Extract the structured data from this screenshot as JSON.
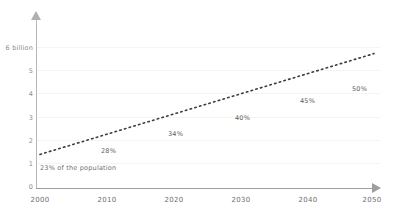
{
  "chart_data": {
    "type": "line",
    "title": "",
    "subtitle": "",
    "xlabel": "",
    "ylabel": "",
    "x": [
      2000,
      2010,
      2020,
      2030,
      2040,
      2050
    ],
    "values": [
      1.2,
      1.9,
      2.6,
      3.3,
      4.05,
      4.8
    ],
    "series": [
      {
        "name": "Urban population",
        "values": [
          1.2,
          1.9,
          2.6,
          3.3,
          4.05,
          4.8
        ]
      }
    ],
    "xlim": [
      2000,
      2050
    ],
    "ylim": [
      0,
      6
    ],
    "grid": true,
    "legend": "none",
    "line_style": "dotted",
    "line_color": "#3c3c3c",
    "y_ticks": [
      {
        "value": 6,
        "label": "6 billion"
      },
      {
        "value": 5,
        "label": "5"
      },
      {
        "value": 4,
        "label": "4"
      },
      {
        "value": 3,
        "label": "3"
      },
      {
        "value": 2,
        "label": "2"
      },
      {
        "value": 1,
        "label": "1"
      },
      {
        "value": 0,
        "label": "0"
      }
    ],
    "x_ticks": [
      {
        "value": 2000,
        "label": "2000"
      },
      {
        "value": 2010,
        "label": "2010"
      },
      {
        "value": 2020,
        "label": "2020"
      },
      {
        "value": 2030,
        "label": "2030"
      },
      {
        "value": 2040,
        "label": "2040"
      },
      {
        "value": 2050,
        "label": "2050"
      }
    ],
    "annotations": [
      {
        "x": 2000,
        "y": 1.2,
        "label": "23% of the population"
      },
      {
        "x": 2010,
        "y": 1.9,
        "label": "28%"
      },
      {
        "x": 2020,
        "y": 2.6,
        "label": "34%"
      },
      {
        "x": 2030,
        "y": 3.3,
        "label": "40%"
      },
      {
        "x": 2040,
        "y": 4.05,
        "label": "45%"
      },
      {
        "x": 2050,
        "y": 4.8,
        "label": "50%"
      }
    ]
  },
  "axis": {
    "y_label_top": "6 billion",
    "y_label_5": "5",
    "y_label_4": "4",
    "y_label_3": "3",
    "y_label_2": "2",
    "y_label_1": "1",
    "y_label_0": "0",
    "x_label_0": "2000",
    "x_label_1": "2010",
    "x_label_2": "2020",
    "x_label_3": "2030",
    "x_label_4": "2040",
    "x_label_5": "2050"
  },
  "labels": {
    "a0": "23% of the population",
    "a1": "28%",
    "a2": "34%",
    "a3": "40%",
    "a4": "45%",
    "a5": "50%"
  },
  "colors": {
    "line": "#3c3c3c",
    "grid": "#f4f4f4",
    "axis": "#a8a8a8",
    "text": "#6f6f6f",
    "background": "#ffffff"
  }
}
